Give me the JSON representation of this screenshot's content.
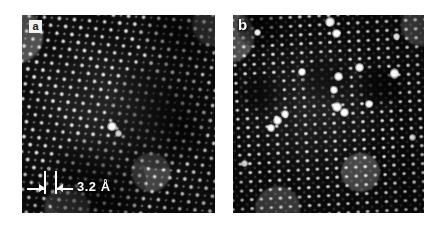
{
  "figure": {
    "type": "micrograph-pair",
    "background_color": "#ffffff",
    "caption_visible": false
  },
  "panels": [
    {
      "id": "a",
      "label": "a",
      "label_style": "boxed-dark-on-white",
      "technique": "HRTEM lattice image",
      "geometry": {
        "x": 22,
        "y": 15,
        "width": 193,
        "height": 198
      },
      "lattice": {
        "orientation": "diagonal",
        "tilt_degrees": -38,
        "spacing_px": 11.2,
        "description": "tilted rows of bright atomic columns running lower-left to upper-right"
      },
      "features": [
        {
          "name": "dark-diffuse-region",
          "x_pct": 58,
          "y_pct": 44,
          "w_pct": 40,
          "h_pct": 44
        },
        {
          "name": "dark-diffuse-region-lower",
          "x_pct": 30,
          "y_pct": 78,
          "w_pct": 34,
          "h_pct": 30
        },
        {
          "name": "bright-atom-cluster",
          "x_pct": 47,
          "y_pct": 56,
          "size_px": 9
        }
      ],
      "scale_bar": {
        "value": "3.2",
        "unit": "Å",
        "text": "3.2 Å",
        "style": "two-tick-double-arrow",
        "color": "#ffffff"
      }
    },
    {
      "id": "b",
      "label": "b",
      "label_style": "plain-white",
      "technique": "HRTEM lattice image",
      "geometry": {
        "x": 233,
        "y": 15,
        "width": 191,
        "height": 198
      },
      "lattice": {
        "orientation": "near-orthogonal",
        "tilt_degrees": -3,
        "spacing_px": 9.6,
        "description": "square grid of bright atomic columns with vertical column contrast"
      },
      "features": [
        {
          "name": "dark-patch",
          "x_pct": 44,
          "y_pct": 30,
          "w_pct": 22,
          "h_pct": 18
        },
        {
          "name": "dark-patch",
          "x_pct": 72,
          "y_pct": 34,
          "w_pct": 18,
          "h_pct": 16
        },
        {
          "name": "dark-patch",
          "x_pct": 12,
          "y_pct": 38,
          "w_pct": 16,
          "h_pct": 14
        },
        {
          "name": "bright-defect-atom",
          "x_pct": 50,
          "y_pct": 4,
          "size_px": 9
        },
        {
          "name": "bright-defect-atom",
          "x_pct": 53,
          "y_pct": 9,
          "size_px": 8
        },
        {
          "name": "bright-defect-atom",
          "x_pct": 36,
          "y_pct": 28,
          "size_px": 7
        },
        {
          "name": "bright-defect-atom",
          "x_pct": 54,
          "y_pct": 30,
          "size_px": 8
        },
        {
          "name": "bright-defect-atom",
          "x_pct": 65,
          "y_pct": 25,
          "size_px": 8
        },
        {
          "name": "bright-defect-atom",
          "x_pct": 83,
          "y_pct": 28,
          "size_px": 8
        },
        {
          "name": "bright-defect-atom",
          "x_pct": 52,
          "y_pct": 37,
          "size_px": 7
        },
        {
          "name": "bright-defect-atom",
          "x_pct": 53,
          "y_pct": 45,
          "size_px": 9
        },
        {
          "name": "bright-defect-atom",
          "x_pct": 57,
          "y_pct": 47,
          "size_px": 8
        },
        {
          "name": "bright-defect-atom",
          "x_pct": 70,
          "y_pct": 44,
          "size_px": 7
        },
        {
          "name": "bright-defect-atom",
          "x_pct": 22,
          "y_pct": 52,
          "size_px": 8
        },
        {
          "name": "bright-defect-atom",
          "x_pct": 26,
          "y_pct": 49,
          "size_px": 7
        },
        {
          "name": "bright-defect-atom",
          "x_pct": 19,
          "y_pct": 56,
          "size_px": 7
        },
        {
          "name": "bright-defect-atom",
          "x_pct": 85,
          "y_pct": 10,
          "size_px": 6
        },
        {
          "name": "bright-defect-atom",
          "x_pct": 12,
          "y_pct": 8,
          "size_px": 6
        }
      ],
      "scale_bar": null
    }
  ]
}
